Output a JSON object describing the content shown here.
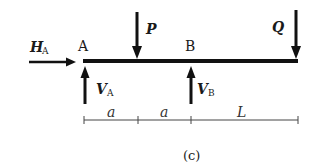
{
  "diagram": {
    "caption": "(c)",
    "beam": {
      "x1": 83,
      "x2": 298,
      "y": 61
    },
    "points": [
      {
        "name": "A",
        "label": "A"
      },
      {
        "name": "B",
        "label": "B"
      }
    ],
    "loads": {
      "P": {
        "symbol": "P",
        "direction": "down"
      },
      "Q": {
        "symbol": "Q",
        "direction": "down"
      }
    },
    "reactions": {
      "HA": {
        "symbol": "H",
        "subscript": "A",
        "direction": "right"
      },
      "VA": {
        "symbol": "V",
        "subscript": "A",
        "direction": "up"
      },
      "VB": {
        "symbol": "V",
        "subscript": "B",
        "direction": "up"
      }
    },
    "dimensions": [
      {
        "label": "a"
      },
      {
        "label": "a"
      },
      {
        "label": "L"
      }
    ],
    "colors": {
      "ink": "#111111",
      "dim_line": "#444444"
    }
  }
}
